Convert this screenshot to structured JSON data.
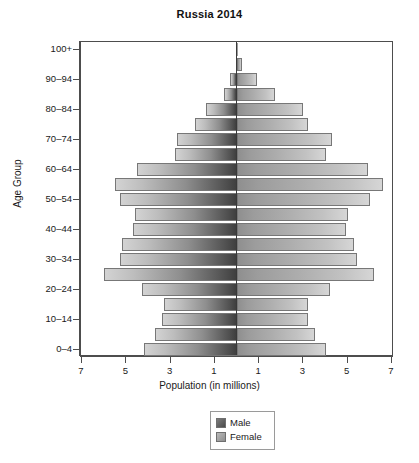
{
  "chart_data": {
    "type": "bar",
    "subtype": "population-pyramid",
    "title": "Russia 2014",
    "xlabel": "Population (in millions)",
    "ylabel": "Age Group",
    "grid": false,
    "legend_position": "bottom-center",
    "xlim": [
      -7,
      7
    ],
    "x_tick_labels": [
      "7",
      "5",
      "3",
      "1",
      "1",
      "3",
      "5",
      "7"
    ],
    "x_tick_values": [
      -7,
      -5,
      -3,
      -1,
      1,
      3,
      5,
      7
    ],
    "y_tick_labels": [
      "100+",
      "90–94",
      "80–84",
      "70–74",
      "60–64",
      "50–54",
      "40–44",
      "30–34",
      "20–24",
      "10–14",
      "0–4"
    ],
    "categories": [
      "0–4",
      "5–9",
      "10–14",
      "15–19",
      "20–24",
      "25–29",
      "30–34",
      "35–39",
      "40–44",
      "45–49",
      "50–54",
      "55–59",
      "60–64",
      "65–69",
      "70–74",
      "75–79",
      "80–84",
      "85–89",
      "90–94",
      "95–99",
      "100+"
    ],
    "series": [
      {
        "name": "Male",
        "color": "#6b6b6b",
        "values": [
          4.2,
          3.7,
          3.4,
          3.3,
          4.3,
          6.0,
          5.3,
          5.2,
          4.7,
          4.6,
          5.3,
          5.5,
          4.5,
          2.8,
          2.7,
          1.9,
          1.4,
          0.6,
          0.3,
          0.06,
          0.01
        ]
      },
      {
        "name": "Female",
        "color": "#b5b5b5",
        "values": [
          4.0,
          3.5,
          3.2,
          3.2,
          4.2,
          6.2,
          5.4,
          5.3,
          4.9,
          5.0,
          6.0,
          6.6,
          5.9,
          4.0,
          4.3,
          3.2,
          3.0,
          1.7,
          0.9,
          0.22,
          0.05
        ]
      }
    ]
  },
  "legend": {
    "items": [
      {
        "label": "Male",
        "key": "male"
      },
      {
        "label": "Female",
        "key": "female"
      }
    ]
  }
}
